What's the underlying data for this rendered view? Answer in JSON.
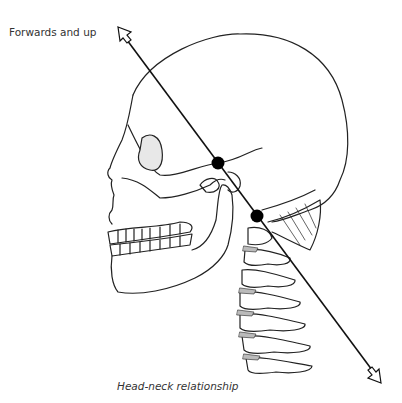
{
  "figure": {
    "direction_label": "Forwards and up",
    "caption": "Head-neck relationship",
    "axis_line": {
      "start": [
        118,
        27
      ],
      "end": [
        381,
        383
      ]
    },
    "pivot_points": [
      {
        "name": "upper-pivot",
        "x": 218,
        "y": 163
      },
      {
        "name": "lower-pivot",
        "x": 257,
        "y": 216
      }
    ],
    "colors": {
      "line": "#111111",
      "dot": "#000000",
      "background": "#ffffff"
    }
  }
}
